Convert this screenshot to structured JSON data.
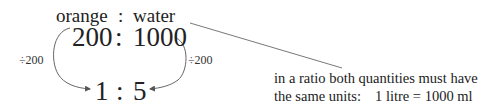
{
  "header": {
    "left_label": "orange",
    "separator": ":",
    "right_label": "water"
  },
  "original_ratio": {
    "left": "200",
    "separator": ":",
    "right": "1000"
  },
  "simplified_ratio": {
    "left": "1",
    "separator": ":",
    "right": "5"
  },
  "operations": {
    "left": "÷200",
    "right": "÷200"
  },
  "annotation": {
    "line1": "in a ratio both quantities must have",
    "line2_label": "the same units:",
    "line2_equation": "1 litre = 1000 ml"
  }
}
